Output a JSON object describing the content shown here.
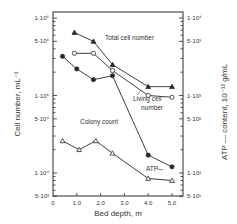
{
  "chart_data": {
    "type": "line",
    "title": "",
    "xlabel": "Bed depth, m",
    "ylabel": "Cell number, mL⁻¹",
    "ylabel_right": "ATP — content, 10⁻¹² g/mL",
    "xlim": [
      0,
      5.5
    ],
    "ylim": [
      5000,
      1000000
    ],
    "ylim_right": [
      50,
      10000
    ],
    "yscale": "log",
    "grid": false,
    "x_ticks": [
      "0",
      "1.0",
      "2.0",
      "3.0",
      "4.0",
      "5.0"
    ],
    "y_ticks_left": [
      "1·10⁶",
      "5·10⁵",
      "1·10⁵",
      "5·10⁴",
      "1·10⁴",
      "5·10³"
    ],
    "y_ticks_right": [
      "1·10⁴",
      "5·10³",
      "1·10³",
      "5·10²",
      "1·10²",
      "5·10¹"
    ],
    "series": [
      {
        "name": "Total cell number",
        "marker": "filled-triangle",
        "axis": "left",
        "x": [
          0.9,
          1.7,
          2.5,
          4.0,
          5.0
        ],
        "values": [
          650000,
          500000,
          250000,
          130000,
          130000
        ]
      },
      {
        "name": "Living cell number",
        "marker": "open-circle",
        "axis": "left",
        "x": [
          0.9,
          1.7,
          2.5,
          4.0,
          5.0
        ],
        "values": [
          350000,
          350000,
          210000,
          100000,
          95000
        ]
      },
      {
        "name": "Colony count",
        "marker": "filled-circle",
        "axis": "left",
        "x": [
          0.4,
          1.0,
          1.7,
          2.5,
          4.0,
          5.0
        ],
        "values": [
          320000,
          220000,
          160000,
          180000,
          17000,
          12000
        ]
      },
      {
        "name": "ATP",
        "marker": "open-triangle",
        "axis": "right",
        "x": [
          0.4,
          1.1,
          1.8,
          2.5,
          4.0,
          5.0
        ],
        "values": [
          260,
          200,
          260,
          180,
          85,
          80
        ]
      }
    ],
    "annotations": [
      "Total cell number",
      "Living cell number",
      "Colony count",
      "ATP"
    ]
  },
  "labels": {
    "total": "Total cell number",
    "living_1": "Living cell",
    "living_2": "number",
    "colony": "Colony count",
    "atp": "ATP"
  }
}
